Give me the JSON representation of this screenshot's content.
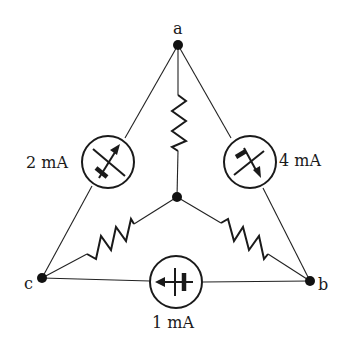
{
  "diagram": {
    "type": "circuit",
    "nodes": [
      {
        "id": "a",
        "label": "a"
      },
      {
        "id": "b",
        "label": "b"
      },
      {
        "id": "c",
        "label": "c"
      },
      {
        "id": "center",
        "label": ""
      }
    ],
    "labels": {
      "node_a": "a",
      "node_b": "b",
      "node_c": "c",
      "source_ca": "2 mA",
      "source_ab": "4 mA",
      "source_bc": "1 mA"
    },
    "current_sources": [
      {
        "between": [
          "c",
          "a"
        ],
        "value": "2 mA",
        "arrow": "toward a"
      },
      {
        "between": [
          "a",
          "b"
        ],
        "value": "4 mA",
        "arrow": "toward b"
      },
      {
        "between": [
          "b",
          "c"
        ],
        "value": "1 mA",
        "arrow": "toward c"
      }
    ],
    "resistors": [
      {
        "between": [
          "a",
          "center"
        ]
      },
      {
        "between": [
          "c",
          "center"
        ]
      },
      {
        "between": [
          "b",
          "center"
        ]
      }
    ]
  }
}
